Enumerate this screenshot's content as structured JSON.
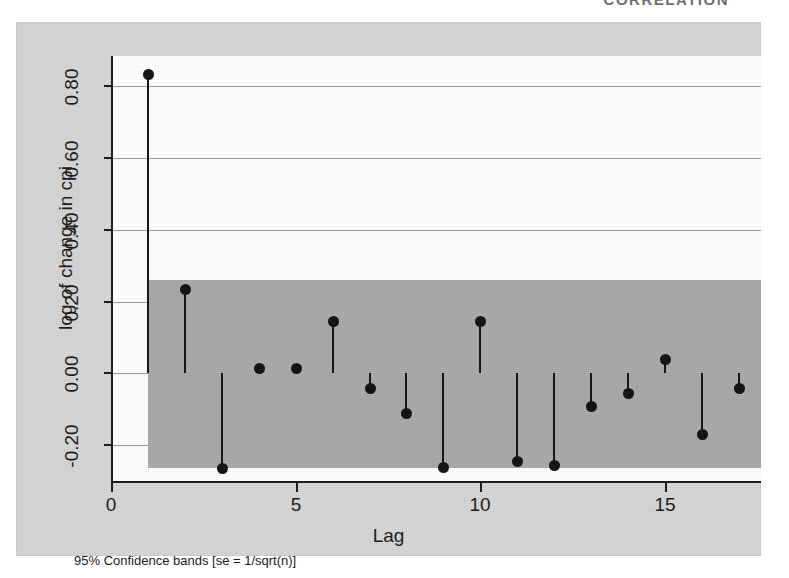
{
  "runhead": "CORRELATION",
  "figure": {
    "note": "95% Confidence bands [se = 1/sqrt(n)]",
    "band_color": "#a9a9a9",
    "marker_color": "#111111",
    "plot_bg": "#ffffff",
    "plate_bg": "#d6d6d6"
  },
  "chart_data": {
    "type": "bar",
    "title": "",
    "subtitle": "",
    "xlabel": "Lag",
    "ylabel": "log of change in cpi",
    "xlim": [
      0,
      17.6
    ],
    "ylim": [
      -0.3,
      0.885
    ],
    "xticks": [
      0,
      5,
      10,
      15
    ],
    "xticklabels": [
      "0",
      "5",
      "10",
      "15"
    ],
    "yticks": [
      -0.2,
      0.0,
      0.2,
      0.4,
      0.6,
      0.8
    ],
    "yticklabels": [
      "-0.20",
      "0.00",
      "0.20",
      "0.40",
      "0.60",
      "0.80"
    ],
    "grid": "horizontal",
    "legend": "none",
    "annotations": [
      "95% Confidence bands [se = 1/sqrt(n)]"
    ],
    "confidence_band": {
      "label": "95% Confidence bands [se = 1/sqrt(n)]",
      "upper": 0.26,
      "lower": -0.265,
      "x_start": 1.0,
      "x_end": 17.6
    },
    "categories": [
      1,
      2,
      3,
      4,
      5,
      6,
      7,
      8,
      9,
      10,
      11,
      12,
      13,
      14,
      15,
      16,
      17
    ],
    "values": [
      0.835,
      0.235,
      -0.265,
      0.015,
      0.015,
      0.145,
      -0.04,
      -0.11,
      -0.26,
      0.145,
      -0.245,
      -0.255,
      -0.09,
      -0.055,
      0.04,
      -0.17,
      -0.04
    ],
    "series": [
      {
        "name": "Autocorrelation of log of change in cpi",
        "values": [
          0.835,
          0.235,
          -0.265,
          0.015,
          0.015,
          0.145,
          -0.04,
          -0.11,
          -0.26,
          0.145,
          -0.245,
          -0.255,
          -0.09,
          -0.055,
          0.04,
          -0.17,
          -0.04
        ]
      }
    ],
    "points": [
      {
        "lag": 1,
        "ac": 0.835
      },
      {
        "lag": 2,
        "ac": 0.235
      },
      {
        "lag": 3,
        "ac": -0.265
      },
      {
        "lag": 4,
        "ac": 0.015
      },
      {
        "lag": 5,
        "ac": 0.015
      },
      {
        "lag": 6,
        "ac": 0.145
      },
      {
        "lag": 7,
        "ac": -0.04
      },
      {
        "lag": 8,
        "ac": -0.11
      },
      {
        "lag": 9,
        "ac": -0.26
      },
      {
        "lag": 10,
        "ac": 0.145
      },
      {
        "lag": 11,
        "ac": -0.245
      },
      {
        "lag": 12,
        "ac": -0.255
      },
      {
        "lag": 13,
        "ac": -0.09
      },
      {
        "lag": 14,
        "ac": -0.055
      },
      {
        "lag": 15,
        "ac": 0.04
      },
      {
        "lag": 16,
        "ac": -0.17
      },
      {
        "lag": 17,
        "ac": -0.04
      }
    ]
  }
}
